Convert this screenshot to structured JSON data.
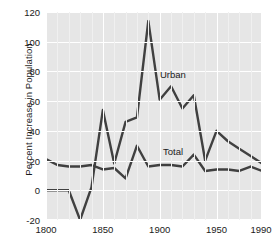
{
  "chart_data": {
    "type": "line",
    "title": "",
    "xlabel": "",
    "ylabel": "Percent Increase in Population",
    "xlim": [
      1800,
      1990
    ],
    "ylim": [
      -20,
      120
    ],
    "grid": true,
    "legend_position": "inline-annotations",
    "xticks": [
      1800,
      1850,
      1900,
      1950,
      1990
    ],
    "yticks": [
      -20,
      0,
      20,
      40,
      60,
      80,
      100,
      120
    ],
    "x": [
      1800,
      1810,
      1820,
      1830,
      1840,
      1850,
      1860,
      1870,
      1880,
      1890,
      1900,
      1910,
      1920,
      1930,
      1940,
      1950,
      1960,
      1970,
      1980,
      1990
    ],
    "series": [
      {
        "name": "Urban",
        "values": [
          0,
          0,
          0,
          -20,
          2,
          54,
          18,
          46,
          49,
          114,
          61,
          70,
          55,
          64,
          20,
          40,
          33,
          28,
          23,
          18
        ],
        "annotation": "Urban"
      },
      {
        "name": "Total",
        "values": [
          21,
          17,
          16,
          16,
          17,
          14,
          15,
          8,
          30,
          16,
          17,
          17,
          16,
          24,
          13,
          14,
          14,
          13,
          16,
          13
        ],
        "annotation": "Total"
      }
    ],
    "annotations": [
      {
        "text": "Urban",
        "x": 1910,
        "y": 74
      },
      {
        "text": "Total",
        "x": 1912,
        "y": 22
      }
    ],
    "colors": {
      "line": "#404040",
      "plot_background": "#e6e6e6",
      "gridline": "#ffffff",
      "text": "#1a1a1a",
      "figure_background": "#ffffff"
    }
  }
}
